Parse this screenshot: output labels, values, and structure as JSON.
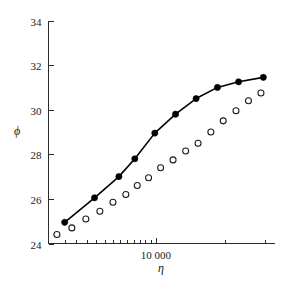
{
  "figure": {
    "clipped_title": "· · · · · · · · · · · ·",
    "background_color": "#ffffff",
    "foreground_color": "#000000"
  },
  "chart_data": {
    "type": "scatter",
    "title": "",
    "xlabel": "η",
    "ylabel": "ϕ",
    "xscale": "log",
    "yscale": "linear",
    "xlim": [
      3400,
      33000
    ],
    "ylim": [
      24,
      34
    ],
    "yticks": [
      24,
      26,
      28,
      30,
      32,
      34
    ],
    "ytick_labels": [
      "24",
      "26",
      "28",
      "30",
      "32",
      "34"
    ],
    "xticks": [
      10000
    ],
    "xtick_labels": [
      "10 000"
    ],
    "x_minor_ticks": [
      4000,
      5000,
      6000,
      7000,
      8000,
      9000,
      10000,
      20000,
      30000
    ],
    "grid": false,
    "legend": false,
    "legend_position": "none",
    "frame": "left-bottom",
    "series": [
      {
        "name": "filled-circles-with-line",
        "marker": "filled-circle",
        "line": "solid",
        "color": "#000000",
        "x": [
          4000,
          5400,
          6900,
          8100,
          9900,
          12200,
          15000,
          18600,
          23000,
          29500
        ],
        "y": [
          24.95,
          26.05,
          27.0,
          27.8,
          28.95,
          29.8,
          30.5,
          31.0,
          31.25,
          31.45
        ]
      },
      {
        "name": "open-circles",
        "marker": "open-circle",
        "line": "none",
        "color": "#1a1a1a",
        "x": [
          3700,
          4300,
          4950,
          5700,
          6500,
          7400,
          8300,
          9300,
          10500,
          11900,
          13500,
          15300,
          17400,
          19700,
          22400,
          25400,
          28800
        ],
        "y": [
          24.4,
          24.7,
          25.1,
          25.45,
          25.85,
          26.2,
          26.6,
          26.95,
          27.4,
          27.75,
          28.15,
          28.5,
          29.0,
          29.5,
          29.95,
          30.4,
          30.75
        ]
      }
    ]
  }
}
